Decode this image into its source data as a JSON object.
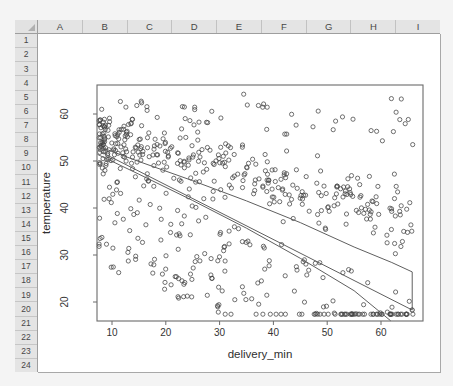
{
  "spreadsheet": {
    "column_headers": [
      "A",
      "B",
      "C",
      "D",
      "E",
      "F",
      "G",
      "H",
      "I"
    ],
    "row_headers": [
      "1",
      "2",
      "3",
      "4",
      "5",
      "6",
      "7",
      "8",
      "9",
      "10",
      "11",
      "12",
      "13",
      "14",
      "15",
      "16",
      "17",
      "18",
      "19",
      "20",
      "21",
      "22",
      "23",
      "24"
    ],
    "header_bg": "#e4e4e4",
    "grid_bg": "#ffffff"
  },
  "chart_data": {
    "type": "scatter",
    "title": "",
    "xlabel": "delivery_min",
    "ylabel": "temperature",
    "x_ticks": [
      10,
      20,
      30,
      40,
      50,
      60
    ],
    "y_ticks": [
      20,
      30,
      40,
      50,
      60
    ],
    "xlim": [
      7.2,
      67.8
    ],
    "ylim": [
      16.0,
      66.2
    ],
    "grid": false,
    "legend": null,
    "n_points_approx": 620,
    "pattern": "dense cluster at low delivery_min with high temperature; strong negative correlation; heteroscedastic scatter below trend",
    "regression_line": {
      "x": [
        7.3,
        65.8
      ],
      "y": [
        52.3,
        18.3
      ]
    },
    "upper_band": [
      [
        7.3,
        53.2
      ],
      [
        15,
        49.9
      ],
      [
        25,
        45.8
      ],
      [
        35,
        41.5
      ],
      [
        45,
        36.9
      ],
      [
        55,
        31.7
      ],
      [
        62,
        28.4
      ],
      [
        65.8,
        26.4
      ]
    ],
    "lower_band": [
      [
        7.3,
        51.4
      ],
      [
        15,
        47.2
      ],
      [
        25,
        41.6
      ],
      [
        35,
        35.7
      ],
      [
        45,
        29.3
      ],
      [
        55,
        22.4
      ],
      [
        61.8,
        16.0
      ]
    ],
    "band_close": {
      "x": 65.8,
      "y_top": 26.4,
      "y_bottom": 18.3
    },
    "end_marker": {
      "x": 65.8,
      "y": 18.3
    },
    "point_style": "open-circle",
    "colors": {
      "points": "#2f2f2f",
      "lines": "#5f5f5f",
      "axis": "#6b6b6b",
      "text": "#333333"
    },
    "layout": {
      "svg_w": 402,
      "svg_h": 338,
      "box": {
        "x1": 59,
        "y1": 51,
        "x2": 385,
        "y2": 287
      },
      "xscale": {
        "a": 20.2,
        "k": 5.38
      },
      "yscale": {
        "a": 362,
        "k": -4.7
      },
      "x_tick_label_y": 302,
      "y_tick_label_x": 30,
      "xlabel_pos": {
        "x": 222,
        "y": 324
      },
      "ylabel_pos": {
        "x": 12,
        "y": 169
      },
      "tick_len": 4,
      "point_r": 2.1
    },
    "generator": {
      "seed": 13,
      "n": 620,
      "x_min": 7.6,
      "x_span": 58.6,
      "x_power": 1.45,
      "x_max": 66,
      "dense_frac": 0.56,
      "dense_intercept": 57.5,
      "dense_slope": -0.3,
      "dense_sd": 3.3,
      "low_frac": 0.34,
      "low_intercept": 52.0,
      "low_slope": -0.52,
      "low_lo": -20,
      "low_hi": 3,
      "high_mean": 58.5,
      "high_sd": 3.0,
      "y_min": 17.4,
      "y_max": 65.2
    }
  }
}
